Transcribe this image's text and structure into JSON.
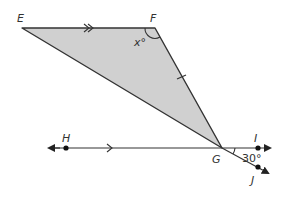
{
  "diagram": {
    "type": "geometry",
    "colors": {
      "fill": "#d0d0d0",
      "stroke": "#333333",
      "background": "#ffffff"
    },
    "points": {
      "E": {
        "label": "E",
        "x": 22,
        "y": 28
      },
      "F": {
        "label": "F",
        "x": 155,
        "y": 28
      },
      "G": {
        "label": "G",
        "x": 222,
        "y": 148
      },
      "H": {
        "label": "H",
        "x": 66,
        "y": 148
      },
      "I": {
        "label": "I",
        "x": 258,
        "y": 148
      },
      "J": {
        "label": "J",
        "x": 258,
        "y": 167
      }
    },
    "angles": {
      "F": {
        "label": "x°"
      },
      "IGJ": {
        "label": "30°"
      }
    },
    "markings": {
      "EF_parallel": "single arrow (parallel to line HI)",
      "HI_parallel": "single arrow (parallel to segment EF)",
      "FG_tick": "single congruence tick"
    }
  }
}
